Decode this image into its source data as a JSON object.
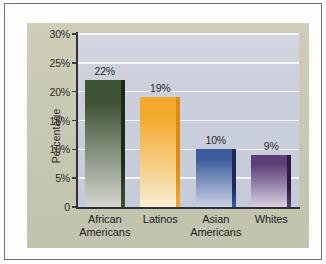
{
  "chart_data": {
    "type": "bar",
    "title": "",
    "subtitle": "",
    "xlabel": "",
    "ylabel": "Percentage",
    "categories": [
      "African Americans",
      "Latinos",
      "Asian Americans",
      "Whites"
    ],
    "category_lines": [
      [
        "African",
        "Americans"
      ],
      [
        "Latinos",
        ""
      ],
      [
        "Asian",
        "Americans"
      ],
      [
        "Whites",
        ""
      ]
    ],
    "values": [
      22,
      19,
      10,
      9
    ],
    "data_labels": [
      "22%",
      "19%",
      "10%",
      "9%"
    ],
    "ylim": [
      0,
      30
    ],
    "ytick_values": [
      0,
      5,
      10,
      15,
      20,
      25,
      30
    ],
    "ytick_labels": [
      "0",
      "5%",
      "10%",
      "15%",
      "20%",
      "25%",
      "30%"
    ],
    "grid": true,
    "grid_axis": "y",
    "legend": false,
    "legend_position": "none",
    "bar_colors": [
      "#3f5336",
      "#f3a92c",
      "#3d5c9c",
      "#5b3f77"
    ],
    "bar_colors_bottom": [
      "#d3d6cf",
      "#f9edd2",
      "#ccd3e6",
      "#d9cfe2"
    ],
    "bar_edge_colors": [
      "#1d2a18",
      "#e08b10",
      "#1b2b55",
      "#2e1a45"
    ]
  },
  "style": {
    "frame_border_color": "#6f6b8e",
    "mat_color": "#fdfdfb",
    "panel_color": "#c9cab3",
    "plot_background_color": "#cbd0dc",
    "gridline_color": "#f4f5f8",
    "axis_color": "#2e3138",
    "text_color": "#2c2c2c"
  }
}
